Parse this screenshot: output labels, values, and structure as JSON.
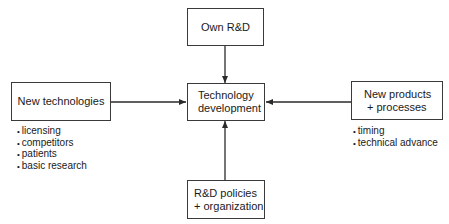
{
  "diagram": {
    "center": {
      "lines": [
        "Technology",
        "development"
      ]
    },
    "top": {
      "lines": [
        "Own R&D"
      ]
    },
    "left": {
      "lines": [
        "New technologies"
      ],
      "bullets": [
        "licensing",
        "competitors",
        "patients",
        "basic research"
      ]
    },
    "right": {
      "lines": [
        "New products",
        "+ processes"
      ],
      "bullets": [
        "timing",
        "technical advance"
      ]
    },
    "bottom": {
      "lines": [
        "R&D policies",
        "+ organization"
      ]
    },
    "colors": {
      "line": "#2a2a2a",
      "box_border": "#3a3a3a",
      "background": "#ffffff"
    }
  }
}
